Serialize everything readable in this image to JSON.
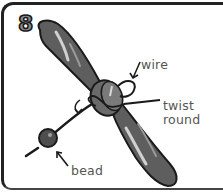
{
  "illustration": {
    "subject": "propeller with wire and bead",
    "step_number": "8",
    "labels": {
      "wire": "wire",
      "twist_line1": "twist",
      "twist_line2": "round",
      "bead": "bead"
    },
    "colors": {
      "blade": "#5e5e5e",
      "blade_highlight": "#c8c8c8",
      "outline": "#1a1a1a",
      "label_text": "#555555",
      "step_number_fill": "#8a8a8a"
    },
    "icons": [
      "propeller-icon",
      "bead-icon",
      "wire-icon",
      "arrow-icon",
      "rotation-arrow-icon"
    ]
  }
}
